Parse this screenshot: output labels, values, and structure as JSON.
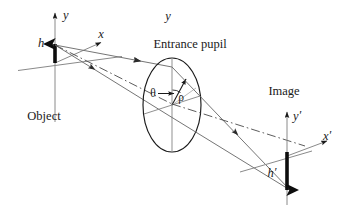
{
  "figure": {
    "background_color": "#ffffff",
    "ink_color": "#1a1a1a",
    "ray_color": "#6e6e6e",
    "axis_color": "#8a8a8a"
  },
  "labels": {
    "object": "Object",
    "entrance_pupil": "Entrance pupil",
    "image": "Image",
    "object_height": "h",
    "image_height": "h",
    "image_height_prime": "′",
    "axis_y": "y",
    "axis_x": "x",
    "axis_y_prime_base": "y",
    "axis_y_prime_mark": "′",
    "axis_x_prime_base": "x",
    "axis_x_prime_mark": "′",
    "pupil_angle": "θ",
    "pupil_radius": "ρ"
  },
  "diagram_elements": {
    "object_plane": {
      "name": "object-plane",
      "axes": [
        "y",
        "x",
        "z"
      ],
      "arrow_label": "h",
      "arrow_direction": "up"
    },
    "entrance_pupil": {
      "name": "entrance-pupil",
      "shape": "ellipse",
      "polar_coordinates": [
        "θ",
        "ρ"
      ]
    },
    "image_plane": {
      "name": "image-plane",
      "axes": [
        "y′",
        "x′",
        "z′"
      ],
      "arrow_label": "h′",
      "arrow_direction": "down"
    },
    "rays": [
      {
        "name": "marginal-ray-upper",
        "style": "solid"
      },
      {
        "name": "marginal-ray-lower",
        "style": "solid"
      },
      {
        "name": "chief-ray",
        "style": "dash-dot"
      }
    ]
  }
}
